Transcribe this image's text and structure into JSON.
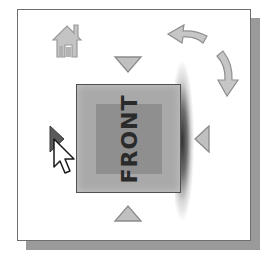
{
  "widget": {
    "name": "ViewCube",
    "current_face": "FRONT"
  },
  "controls": {
    "home": {
      "icon": "home-icon"
    },
    "rotate": {
      "icon": "rotate-arrows-icon"
    },
    "arrows": [
      {
        "direction": "up",
        "icon": "triangle-down-icon"
      },
      {
        "direction": "down",
        "icon": "triangle-up-icon"
      },
      {
        "direction": "left",
        "icon": "triangle-right-icon"
      },
      {
        "direction": "right",
        "icon": "triangle-left-icon"
      }
    ]
  },
  "cursor": {
    "icon": "pointer-cursor-icon"
  },
  "colors": {
    "frame_border": "#6e6e6e",
    "shadow": "#9a9a9a",
    "face_outer": "#a9a9a9",
    "face_inner": "#8f8f8f",
    "face_text": "#2a2a2a",
    "icon_fill": "#c8c8c8",
    "icon_stroke": "#8a8a8a"
  }
}
